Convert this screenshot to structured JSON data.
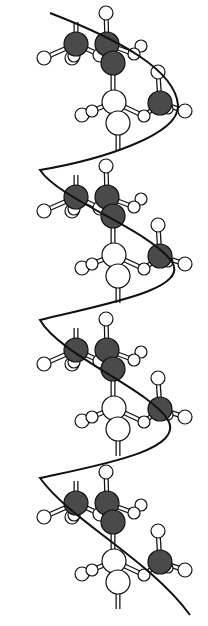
{
  "diagram": {
    "type": "ball-and-stick molecular helix",
    "width": 208,
    "height": 626,
    "colors": {
      "background": "#ffffff",
      "dark_atom": "#4a4a4a",
      "light_atom": "#ffffff",
      "outline": "#111111",
      "helix_line": "#111111"
    },
    "repeat_units": 4,
    "unit_spacing_y": 153,
    "unit": {
      "dark_atoms": [
        [
          76,
          44,
          12
        ],
        [
          107,
          44,
          12
        ],
        [
          113,
          63,
          12
        ],
        [
          160,
          103,
          12
        ]
      ],
      "white_atoms": [
        [
          114,
          102,
          12
        ],
        [
          118,
          123,
          12
        ],
        [
          74,
          56,
          6
        ],
        [
          100,
          55,
          7
        ]
      ],
      "hydrogens": [
        [
          44,
          58,
          7
        ],
        [
          72,
          58,
          7
        ],
        [
          106,
          13,
          7
        ],
        [
          141,
          46,
          6
        ],
        [
          134,
          54,
          6
        ],
        [
          158,
          72,
          7
        ],
        [
          185,
          111,
          7
        ],
        [
          144,
          116,
          6
        ],
        [
          82,
          115,
          7
        ],
        [
          92,
          111,
          6
        ],
        [
          168,
          109,
          5
        ]
      ],
      "bonds": [
        [
          76,
          44,
          44,
          58
        ],
        [
          76,
          44,
          76,
          22
        ],
        [
          76,
          44,
          100,
          55
        ],
        [
          107,
          44,
          106,
          13
        ],
        [
          107,
          44,
          134,
          54
        ],
        [
          113,
          63,
          113,
          102
        ],
        [
          160,
          103,
          158,
          72
        ],
        [
          160,
          103,
          185,
          111
        ],
        [
          160,
          103,
          144,
          116
        ],
        [
          114,
          102,
          82,
          115
        ],
        [
          114,
          102,
          144,
          116
        ],
        [
          118,
          123,
          118,
          150
        ]
      ]
    },
    "helix_path": "M 50 13 C 120 40, 175 70, 178 105 C 180 135, 100 160, 40 170 C 60 200, 150 230, 172 262 C 190 290, 100 305, 40 320 C 60 355, 150 390, 168 420 C 185 450, 100 465, 40 478 C 70 520, 150 560, 190 615"
  }
}
